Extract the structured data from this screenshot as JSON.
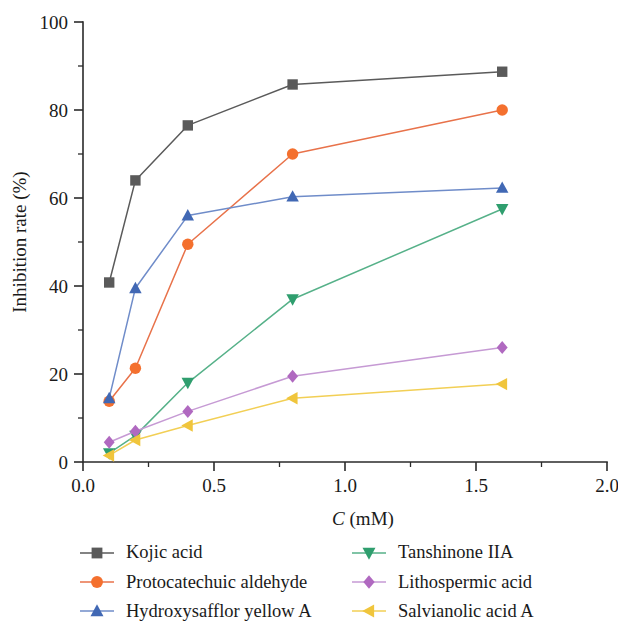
{
  "chart_data": {
    "type": "line",
    "title": "",
    "xlabel": "C (mM)",
    "xlabel_italic_prefix": "C",
    "xlabel_rest": " (mM)",
    "ylabel": "Inhibition rate (%)",
    "xlim": [
      0.0,
      2.0
    ],
    "ylim": [
      0,
      100
    ],
    "x_ticks": [
      0.0,
      0.5,
      1.0,
      1.5,
      2.0
    ],
    "x_tick_labels": [
      "0.0",
      "0.5",
      "1.0",
      "1.5",
      "2.0"
    ],
    "x_minor_ticks": [
      0.25,
      0.75,
      1.25,
      1.75
    ],
    "y_ticks": [
      0,
      20,
      40,
      60,
      80,
      100
    ],
    "y_tick_labels": [
      "0",
      "20",
      "40",
      "60",
      "80",
      "100"
    ],
    "y_minor_ticks": [
      10,
      30,
      50,
      70,
      90
    ],
    "grid": false,
    "legend_position": "bottom",
    "legend_columns": 2,
    "x": [
      0.1,
      0.2,
      0.4,
      0.8,
      1.6
    ],
    "series": [
      {
        "name": "Kojic acid",
        "color": "#5a5a5a",
        "marker": "square",
        "values": [
          40.8,
          64.0,
          76.5,
          85.8,
          88.7
        ]
      },
      {
        "name": "Protocatechuic aldehyde",
        "color": "#f4702e",
        "line_color": "#e8724a",
        "marker": "circle",
        "values": [
          13.8,
          21.3,
          49.5,
          70.0,
          80.0
        ]
      },
      {
        "name": "Hydroxysafflor yellow A",
        "color": "#4168b4",
        "line_color": "#6f8cc9",
        "marker": "triangle-up",
        "values": [
          14.5,
          39.5,
          56.0,
          60.3,
          62.3
        ]
      },
      {
        "name": "Tanshinone IIA",
        "color": "#2f9e6e",
        "line_color": "#56b189",
        "marker": "triangle-down",
        "values": [
          2.0,
          6.0,
          18.0,
          37.0,
          57.5
        ]
      },
      {
        "name": "Lithospermic acid",
        "color": "#b069c0",
        "line_color": "#c69ad4",
        "marker": "diamond",
        "values": [
          4.5,
          7.0,
          11.5,
          19.5,
          26.0
        ]
      },
      {
        "name": "Salvianolic acid A",
        "color": "#f0c53c",
        "line_color": "#f2cf55",
        "marker": "triangle-left",
        "values": [
          1.5,
          5.0,
          8.3,
          14.5,
          17.7
        ]
      }
    ]
  },
  "legend": {
    "entries": [
      {
        "label": "Kojic acid"
      },
      {
        "label": "Tanshinone IIA"
      },
      {
        "label": "Protocatechuic aldehyde"
      },
      {
        "label": "Lithospermic acid"
      },
      {
        "label": "Hydroxysafflor yellow A"
      },
      {
        "label": "Salvianolic acid A"
      }
    ]
  }
}
